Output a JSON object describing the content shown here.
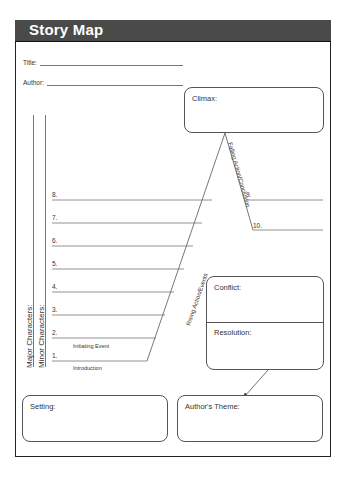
{
  "header": {
    "title": "Story Map"
  },
  "fields": {
    "title_label": "Title:",
    "author_label": "Author:"
  },
  "characters": {
    "major_label": "Major Characters:",
    "minor_label": "Minor Characters:"
  },
  "plot": {
    "rising_label": "Rising Action/Events",
    "falling_label": "Falling Action/Conclusion",
    "initiating_label": "Initiating Event",
    "introduction_label": "Introduction",
    "events": [
      "1.",
      "2.",
      "3.",
      "4.",
      "5.",
      "6.",
      "7.",
      "8.",
      "9.",
      "10."
    ]
  },
  "boxes": {
    "climax": "Climax:",
    "conflict": "Conflict:",
    "resolution": "Resolution:",
    "setting": "Setting:",
    "theme": "Author's Theme:"
  }
}
